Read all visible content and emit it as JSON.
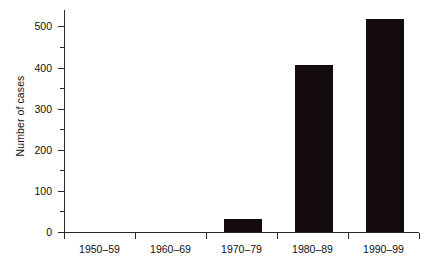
{
  "chart_data": {
    "type": "bar",
    "title": "",
    "subtitle": "",
    "xlabel": "",
    "ylabel": "Number of cases",
    "categories": [
      "1950–59",
      "1960–69",
      "1970–79",
      "1980–89",
      "1990–99"
    ],
    "values": [
      0,
      0,
      32,
      405,
      517
    ],
    "series": [
      {
        "name": "Number of cases",
        "values": [
          0,
          0,
          32,
          405,
          517
        ]
      }
    ],
    "ylim": [
      0,
      540
    ],
    "ytick_labels": [
      "0",
      "100",
      "200",
      "300",
      "400",
      "500"
    ],
    "ytick_values": [
      0,
      100,
      200,
      300,
      400,
      500
    ],
    "yminor_tick_values": [
      50,
      150,
      250,
      350,
      450
    ],
    "grid": false,
    "legend": null,
    "legend_position": "none",
    "bar_color": "#140c0c",
    "axis_color": "#2b2b2b",
    "background_color": "#ffffff"
  },
  "axes": {
    "y_title": "Number of cases"
  }
}
